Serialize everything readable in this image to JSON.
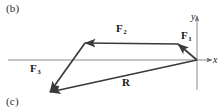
{
  "figure": {
    "panel_labels": [
      {
        "id": "b",
        "text": "(b)"
      },
      {
        "id": "c",
        "text": "(c)"
      }
    ],
    "axes": {
      "x_label": "x",
      "y_label": "y",
      "origin": {
        "x": 197,
        "y": 60
      },
      "x_axis": {
        "x1": 8,
        "y1": 60,
        "x2": 212,
        "y2": 60
      },
      "y_axis": {
        "x1": 197,
        "y1": 90,
        "x2": 197,
        "y2": 16
      },
      "axis_color": "#8d8d8d"
    },
    "vector_color": "#3a3a3a",
    "vectors": [
      {
        "name": "F1",
        "label": "F",
        "subscript": "1",
        "tail": {
          "x": 197,
          "y": 60
        },
        "tip": {
          "x": 178,
          "y": 44
        }
      },
      {
        "name": "F2",
        "label": "F",
        "subscript": "2",
        "tail": {
          "x": 178,
          "y": 44
        },
        "tip": {
          "x": 85,
          "y": 43
        }
      },
      {
        "name": "F3",
        "label": "F",
        "subscript": "3",
        "tail": {
          "x": 85,
          "y": 43
        },
        "tip": {
          "x": 50,
          "y": 92
        }
      },
      {
        "name": "R",
        "label": "R",
        "subscript": "",
        "tail": {
          "x": 197,
          "y": 60
        },
        "tip": {
          "x": 50,
          "y": 92
        }
      }
    ]
  }
}
